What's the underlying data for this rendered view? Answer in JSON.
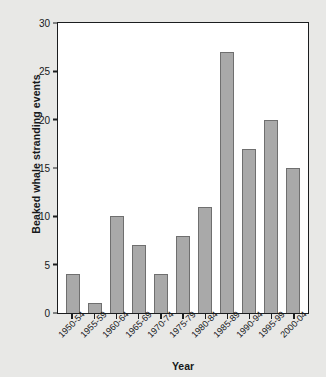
{
  "chart_data": {
    "type": "bar",
    "title": "",
    "xlabel": "Year",
    "ylabel": "Beaked whale stranding events",
    "categories": [
      "1950-54",
      "1955-59",
      "1960-64",
      "1965-69",
      "1970-74",
      "1975-79",
      "1980-84",
      "1985-89",
      "1990-94",
      "1995-99",
      "2000-04"
    ],
    "values": [
      4,
      1,
      10,
      7,
      4,
      8,
      11,
      27,
      17,
      20,
      15
    ],
    "ylim": [
      0,
      30
    ],
    "yticks": [
      0,
      5,
      10,
      15,
      20,
      25,
      30
    ],
    "ytick_labels": [
      "0",
      "5",
      "10",
      "15",
      "20",
      "25",
      "30"
    ],
    "grid": false,
    "legend": null,
    "bar_color": "#a9a9a9",
    "bar_edge_color": "#6f6f6f",
    "plot_background": "#ffffff",
    "figure_background": "#e8e8e6",
    "axis_color": "#1b1d1f"
  }
}
